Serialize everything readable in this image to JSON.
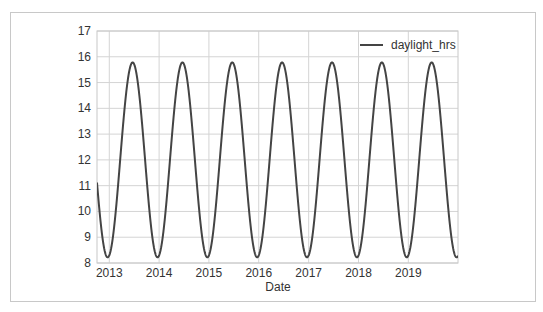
{
  "chart_data": {
    "type": "line",
    "title": "",
    "xlabel": "Date",
    "ylabel": "",
    "ylim": [
      8,
      17
    ],
    "xlim": [
      "2012-10-03",
      "2019-12-31"
    ],
    "yticks": [
      8,
      9,
      10,
      11,
      12,
      13,
      14,
      15,
      16,
      17
    ],
    "xticks": [
      "2013",
      "2014",
      "2015",
      "2016",
      "2017",
      "2018",
      "2019"
    ],
    "grid": true,
    "legend_position": "upper right",
    "colors": {
      "line": "#444444",
      "grid": "#d4d4d4",
      "axes_edge": "#c8c8c8"
    },
    "series": [
      {
        "name": "daylight_hrs",
        "x": [
          "2012-10-03",
          "2012-12-21",
          "2013-03-21",
          "2013-06-21",
          "2013-09-21",
          "2013-12-21",
          "2014-03-21",
          "2014-06-21",
          "2014-09-21",
          "2014-12-21",
          "2015-03-21",
          "2015-06-21",
          "2015-09-21",
          "2015-12-21",
          "2016-03-21",
          "2016-06-21",
          "2016-09-21",
          "2016-12-21",
          "2017-03-21",
          "2017-06-21",
          "2017-09-21",
          "2017-12-21",
          "2018-03-21",
          "2018-06-21",
          "2018-09-21",
          "2018-12-21",
          "2019-03-21",
          "2019-06-21",
          "2019-09-21",
          "2019-12-21",
          "2019-12-31"
        ],
        "values": [
          11.3,
          8.2,
          12.0,
          15.8,
          12.0,
          8.2,
          12.0,
          15.8,
          12.0,
          8.2,
          12.0,
          15.8,
          12.0,
          8.2,
          12.0,
          15.8,
          12.0,
          8.2,
          12.0,
          15.8,
          12.0,
          8.2,
          12.0,
          15.8,
          12.0,
          8.2,
          12.0,
          15.8,
          12.0,
          8.2,
          8.25
        ],
        "model": {
          "mean": 12.0,
          "amplitude": 3.78,
          "period_days": 365.25,
          "peak_day_of_year": 172
        }
      }
    ]
  },
  "legend": {
    "label": "daylight_hrs"
  },
  "axes": {
    "xlabel": "Date"
  }
}
